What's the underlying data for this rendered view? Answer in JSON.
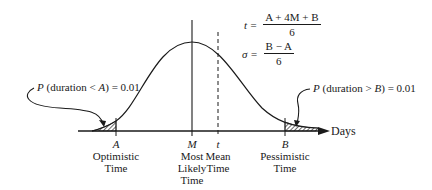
{
  "diagram": {
    "type": "beta-distribution-pert",
    "axis_label": "Days",
    "points": [
      {
        "symbol": "A",
        "label_lines": [
          "Optimistic",
          "Time"
        ]
      },
      {
        "symbol": "M",
        "label_lines": [
          "Most",
          "Likely",
          "Time"
        ]
      },
      {
        "symbol": "t",
        "label_lines": [
          "Mean",
          "Time"
        ]
      },
      {
        "symbol": "B",
        "label_lines": [
          "Pessimistic",
          "Time"
        ]
      }
    ],
    "formulas": {
      "mean": {
        "lhs": "t =",
        "numerator": "A + 4M + B",
        "denominator": "6"
      },
      "sigma": {
        "lhs": "σ =",
        "numerator": "B − A",
        "denominator": "6"
      }
    },
    "annotations": {
      "left_tail": {
        "p": "P",
        "text": " (duration < ",
        "var": "A",
        "tail": ") = 0.01"
      },
      "right_tail": {
        "p": "P",
        "text": " (duration > ",
        "var": "B",
        "tail": ") = 0.01"
      }
    }
  }
}
